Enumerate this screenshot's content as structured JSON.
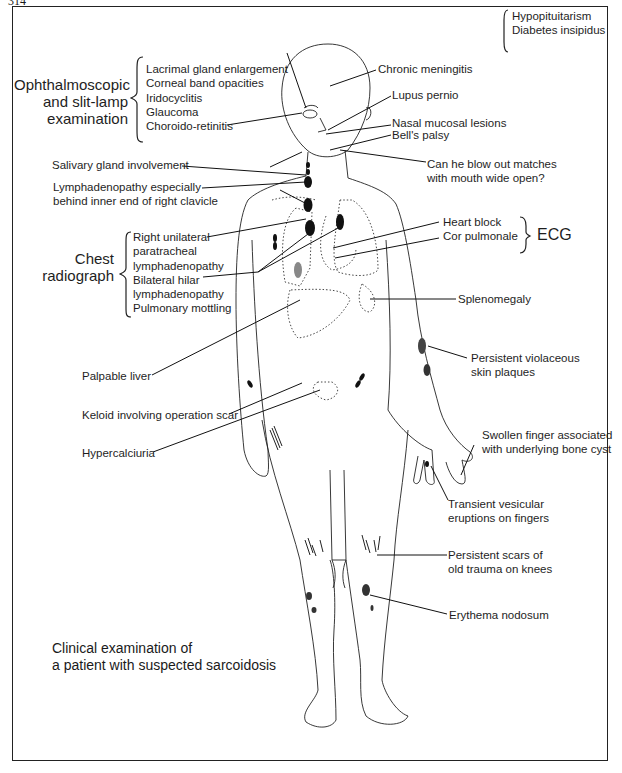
{
  "page": {
    "number": "314"
  },
  "figure": {
    "caption": [
      "Clinical examination of",
      "a patient with suspected sarcoidosis"
    ],
    "groups": {
      "ophthalmoscopic": {
        "title": [
          "Ophthalmoscopic",
          "and slit-lamp",
          "examination"
        ],
        "items": [
          "Lacrimal gland enlargement",
          "Corneal band opacities",
          "Iridocyclitis",
          "Glaucoma",
          "Choroido-retinitis"
        ]
      },
      "chest_radiograph": {
        "title": [
          "Chest",
          "radiograph"
        ],
        "items": [
          "Right unilateral",
          "paratracheal",
          "lymphadenopathy",
          "Bilateral hilar",
          "lymphadenopathy",
          "Pulmonary mottling"
        ]
      },
      "ecg": {
        "title": "ECG",
        "items": [
          "Heart block",
          "Cor pulmonale"
        ]
      },
      "pituitary": {
        "items": [
          "Hypopituitarism",
          "Diabetes insipidus"
        ]
      }
    },
    "labels": {
      "chronic_meningitis": "Chronic meningitis",
      "lupus_pernio": "Lupus pernio",
      "nasal_mucosal": "Nasal mucosal lesions",
      "bells_palsy": "Bell's palsy",
      "blow_matches": [
        "Can he blow out matches",
        "with mouth wide open?"
      ],
      "salivary": "Salivary gland involvement",
      "lymphadenopathy": [
        "Lymphadenopathy especially",
        "behind inner end of right clavicle"
      ],
      "splenomegaly": "Splenomegaly",
      "palpable_liver": "Palpable liver",
      "keloid": "Keloid involving operation scar",
      "hypercalciuria": "Hypercalciuria",
      "violaceous": [
        "Persistent violaceous",
        "skin plaques"
      ],
      "swollen_finger": [
        "Swollen finger associated",
        "with underlying bone cyst"
      ],
      "vesicular": [
        "Transient vesicular",
        "eruptions on fingers"
      ],
      "scars": [
        "Persistent scars of",
        "old trauma on knees"
      ],
      "erythema": "Erythema nodosum"
    }
  }
}
